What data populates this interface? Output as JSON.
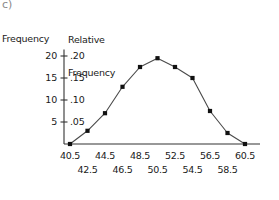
{
  "figure": {
    "corner_label": "c)",
    "left_axis_title": "Frequency",
    "right_axis_title_line1": "Relative",
    "right_axis_title_line2": "Frequency"
  },
  "chart_data": {
    "type": "line",
    "title": "",
    "subtitle": "",
    "xlabel": "",
    "ylabel": "Frequency",
    "y2label": "Relative Frequency",
    "grid": false,
    "legend": "none",
    "x": [
      40.5,
      42.5,
      44.5,
      46.5,
      48.5,
      50.5,
      52.5,
      54.5,
      56.5,
      58.5,
      60.5
    ],
    "values": [
      0.0,
      0.03,
      0.07,
      0.13,
      0.175,
      0.195,
      0.175,
      0.15,
      0.075,
      0.025,
      0.0
    ],
    "frequency_values": [
      0,
      3,
      7,
      13,
      17.5,
      19.5,
      17.5,
      15,
      7.5,
      2.5,
      0
    ],
    "xlim": [
      39.5,
      61.5
    ],
    "ylim": [
      0,
      0.215
    ],
    "y_ticks_left": [
      "5",
      "10",
      "15",
      "20"
    ],
    "y_tick_values_left": [
      5,
      10,
      15,
      20
    ],
    "y_ticks_right": [
      ".05",
      ".10",
      ".15",
      ".20"
    ],
    "y_tick_values_right": [
      0.05,
      0.1,
      0.15,
      0.2
    ],
    "x_ticks_row1": [
      "40.5",
      "44.5",
      "48.5",
      "52.5",
      "56.5",
      "60.5"
    ],
    "x_tick_values_row1": [
      40.5,
      44.5,
      48.5,
      52.5,
      56.5,
      60.5
    ],
    "x_ticks_row2": [
      "42.5",
      "46.5",
      "50.5",
      "54.5",
      "58.5"
    ],
    "x_tick_values_row2": [
      42.5,
      46.5,
      50.5,
      54.5,
      58.5
    ],
    "marker": "square",
    "marker_color": "#111111",
    "line_color": "#4a4a4a",
    "axis_color": "#333333"
  }
}
